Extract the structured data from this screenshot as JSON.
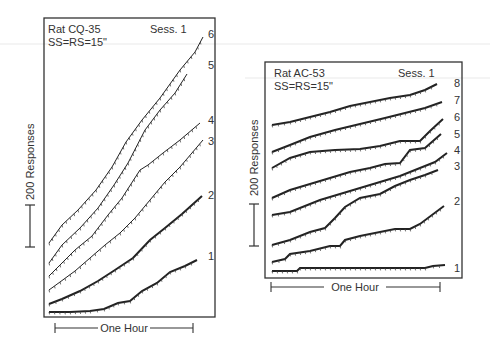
{
  "chart_data": [
    {
      "type": "line",
      "title": "Rat CQ-35",
      "subtitle": "SS=RS=15\"",
      "session_label": "Sess. 1",
      "xlabel": "One Hour",
      "ylabel": "200 Responses",
      "description": "Cumulative records, sessions stacked by curve number",
      "legend": [
        "1",
        "2",
        "3",
        "4",
        "5",
        "6"
      ],
      "series": [
        {
          "name": "1",
          "points": [
            [
              49,
              312
            ],
            [
              70,
              312
            ],
            [
              90,
              311
            ],
            [
              104,
              309
            ],
            [
              118,
              303
            ],
            [
              130,
              301
            ],
            [
              142,
              291
            ],
            [
              157,
              283
            ],
            [
              170,
              272
            ],
            [
              185,
              266
            ],
            [
              197,
              260
            ]
          ]
        },
        {
          "name": "2",
          "points": [
            [
              49,
              304
            ],
            [
              62,
              299
            ],
            [
              80,
              291
            ],
            [
              98,
              281
            ],
            [
              115,
              270
            ],
            [
              133,
              258
            ],
            [
              150,
              240
            ],
            [
              165,
              228
            ],
            [
              182,
              214
            ],
            [
              202,
              196
            ]
          ]
        },
        {
          "name": "3",
          "points": [
            [
              49,
              290
            ],
            [
              60,
              282
            ],
            [
              75,
              271
            ],
            [
              90,
              258
            ],
            [
              105,
              245
            ],
            [
              120,
              233
            ],
            [
              135,
              218
            ],
            [
              150,
              200
            ],
            [
              165,
              182
            ],
            [
              180,
              167
            ],
            [
              203,
              140
            ]
          ]
        },
        {
          "name": "4",
          "points": [
            [
              49,
              276
            ],
            [
              60,
              265
            ],
            [
              75,
              250
            ],
            [
              92,
              236
            ],
            [
              108,
              215
            ],
            [
              122,
              198
            ],
            [
              140,
              170
            ],
            [
              148,
              165
            ],
            [
              163,
              153
            ],
            [
              180,
              140
            ],
            [
              200,
              123
            ]
          ]
        },
        {
          "name": "5",
          "points": [
            [
              49,
              263
            ],
            [
              62,
              245
            ],
            [
              80,
              228
            ],
            [
              98,
              208
            ],
            [
              114,
              185
            ],
            [
              128,
              163
            ],
            [
              145,
              130
            ],
            [
              160,
              110
            ],
            [
              175,
              93
            ],
            [
              187,
              74
            ]
          ]
        },
        {
          "name": "6",
          "points": [
            [
              49,
              243
            ],
            [
              62,
              225
            ],
            [
              78,
              210
            ],
            [
              96,
              190
            ],
            [
              112,
              167
            ],
            [
              126,
              142
            ],
            [
              142,
              120
            ],
            [
              160,
              98
            ],
            [
              180,
              70
            ],
            [
              195,
              52
            ],
            [
              203,
              37
            ]
          ]
        }
      ],
      "data_units": "pixel coordinates (x right, y down) of the traced cumulative record"
    },
    {
      "type": "line",
      "title": "Rat AC-53",
      "subtitle": "SS=RS=15\"",
      "session_label": "Sess. 1",
      "xlabel": "One Hour",
      "ylabel": "200 Responses",
      "description": "Cumulative records, sessions stacked by curve number",
      "legend": [
        "1",
        "2",
        "3",
        "4",
        "5",
        "6",
        "7",
        "8"
      ],
      "series": [
        {
          "name": "1",
          "points": [
            [
              272,
              271
            ],
            [
              297,
              271
            ],
            [
              300,
              268
            ],
            [
              330,
              268
            ],
            [
              360,
              268
            ],
            [
              395,
              268
            ],
            [
              425,
              268
            ],
            [
              433,
              266
            ],
            [
              445,
              265
            ]
          ]
        },
        {
          "name": "2",
          "points": [
            [
              272,
              262
            ],
            [
              285,
              259
            ],
            [
              290,
              254
            ],
            [
              310,
              251
            ],
            [
              330,
              246
            ],
            [
              340,
              246
            ],
            [
              345,
              240
            ],
            [
              360,
              236
            ],
            [
              375,
              233
            ],
            [
              395,
              229
            ],
            [
              410,
              229
            ],
            [
              420,
              224
            ],
            [
              444,
              206
            ]
          ]
        },
        {
          "name": "3",
          "points": [
            [
              272,
              245
            ],
            [
              290,
              240
            ],
            [
              310,
              232
            ],
            [
              325,
              228
            ],
            [
              335,
              218
            ],
            [
              345,
              207
            ],
            [
              360,
              198
            ],
            [
              380,
              194
            ],
            [
              395,
              186
            ],
            [
              410,
              180
            ],
            [
              425,
              175
            ],
            [
              438,
              170
            ]
          ]
        },
        {
          "name": "4",
          "points": [
            [
              272,
              215
            ],
            [
              290,
              212
            ],
            [
              305,
              206
            ],
            [
              320,
              200
            ],
            [
              340,
              194
            ],
            [
              360,
              188
            ],
            [
              380,
              182
            ],
            [
              400,
              176
            ],
            [
              420,
              168
            ],
            [
              435,
              162
            ],
            [
              447,
              153
            ]
          ]
        },
        {
          "name": "5",
          "points": [
            [
              272,
              198
            ],
            [
              290,
              190
            ],
            [
              310,
              184
            ],
            [
              330,
              178
            ],
            [
              350,
              172
            ],
            [
              370,
              168
            ],
            [
              385,
              164
            ],
            [
              400,
              163
            ],
            [
              410,
              150
            ],
            [
              425,
              148
            ],
            [
              441,
              134
            ]
          ]
        },
        {
          "name": "6",
          "points": [
            [
              272,
              168
            ],
            [
              290,
              158
            ],
            [
              310,
              152
            ],
            [
              335,
              150
            ],
            [
              360,
              149
            ],
            [
              380,
              146
            ],
            [
              400,
              141
            ],
            [
              420,
              141
            ],
            [
              430,
              131
            ],
            [
              443,
              119
            ]
          ]
        },
        {
          "name": "7",
          "points": [
            [
              272,
              152
            ],
            [
              290,
              145
            ],
            [
              310,
              137
            ],
            [
              335,
              130
            ],
            [
              360,
              124
            ],
            [
              385,
              118
            ],
            [
              405,
              113
            ],
            [
              425,
              108
            ],
            [
              442,
              102
            ]
          ]
        },
        {
          "name": "8",
          "points": [
            [
              272,
              125
            ],
            [
              290,
              122
            ],
            [
              310,
              117
            ],
            [
              330,
              112
            ],
            [
              350,
              106
            ],
            [
              370,
              102
            ],
            [
              390,
              98
            ],
            [
              410,
              95
            ],
            [
              425,
              90
            ],
            [
              437,
              84
            ]
          ]
        }
      ],
      "data_units": "pixel coordinates (x right, y down) of the traced cumulative record"
    }
  ],
  "panels": {
    "left": {
      "title": "Rat CQ-35",
      "params": "SS=RS=15\"",
      "session": "Sess. 1",
      "scale_label": "200 Responses",
      "time_label": "One Hour",
      "curve_labels": [
        {
          "text": "6",
          "x": 208,
          "y": 38
        },
        {
          "text": "5",
          "x": 208,
          "y": 69
        },
        {
          "text": "4",
          "x": 208,
          "y": 124
        },
        {
          "text": "3",
          "x": 208,
          "y": 145
        },
        {
          "text": "2",
          "x": 208,
          "y": 199
        },
        {
          "text": "1",
          "x": 208,
          "y": 260
        }
      ]
    },
    "right": {
      "title": "Rat AC-53",
      "params": "SS=RS=15\"",
      "session": "Sess. 1",
      "scale_label": "200 Responses",
      "time_label": "One Hour",
      "curve_labels": [
        {
          "text": "8",
          "x": 454,
          "y": 87
        },
        {
          "text": "7",
          "x": 454,
          "y": 104
        },
        {
          "text": "6",
          "x": 454,
          "y": 121
        },
        {
          "text": "5",
          "x": 454,
          "y": 138
        },
        {
          "text": "4",
          "x": 454,
          "y": 154
        },
        {
          "text": "3",
          "x": 454,
          "y": 170
        },
        {
          "text": "2",
          "x": 454,
          "y": 205
        },
        {
          "text": "1",
          "x": 454,
          "y": 272
        }
      ]
    }
  }
}
